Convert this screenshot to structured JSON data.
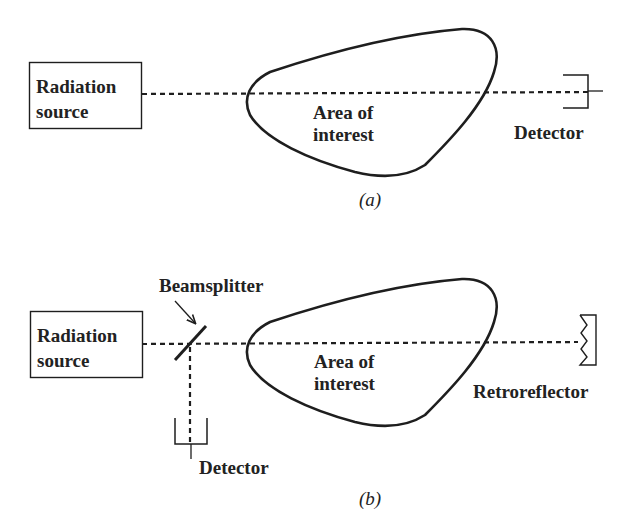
{
  "panels": [
    {
      "id": "a",
      "caption": "(a)",
      "source_label_line1": "Radiation",
      "source_label_line2": "source",
      "area_label_line1": "Area of",
      "area_label_line2": "interest",
      "detector_label": "Detector"
    },
    {
      "id": "b",
      "caption": "(b)",
      "source_label_line1": "Radiation",
      "source_label_line2": "source",
      "beamsplitter_label": "Beamsplitter",
      "area_label_line1": "Area of",
      "area_label_line2": "interest",
      "detector_label": "Detector",
      "retroreflector_label": "Retroreflector"
    }
  ],
  "colors": {
    "stroke": "#1e1e1e",
    "background": "#ffffff"
  }
}
